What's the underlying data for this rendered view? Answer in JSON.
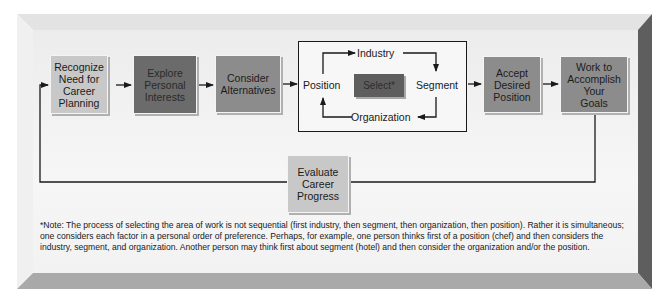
{
  "diagram": {
    "steps": [
      {
        "id": "recognize",
        "label_lines": [
          "Recognize",
          "Need for",
          "Career",
          "Planning"
        ]
      },
      {
        "id": "explore",
        "label_lines": [
          "Explore",
          "Personal",
          "Interests"
        ]
      },
      {
        "id": "consider",
        "label_lines": [
          "Consider",
          "Alternatives"
        ]
      },
      {
        "id": "accept",
        "label_lines": [
          "Accept",
          "Desired",
          "Position"
        ]
      },
      {
        "id": "work",
        "label_lines": [
          "Work to",
          "Accomplish",
          "Your",
          "Goals"
        ]
      },
      {
        "id": "evaluate",
        "label_lines": [
          "Evaluate",
          "Career",
          "Progress"
        ]
      }
    ],
    "selection_cycle": {
      "center": "Select*",
      "nodes": {
        "industry": "Industry",
        "segment": "Segment",
        "organization": "Organization",
        "position": "Position"
      }
    },
    "note": "*Note: The process of selecting the area of work is not sequential (first industry, then segment, then organization, then position). Rather it is simultaneous; one considers each factor in a personal order of preference. Perhaps, for example, one person thinks first of a position (chef) and then considers the industry, segment, and organization. Another person may think first about segment (hotel) and then consider the organization and/or the position."
  },
  "colors": {
    "light_box": "#c8c8c8",
    "mid_box": "#8c8c8c",
    "dark_box": "#6b6b6b",
    "select_box": "#5e5e5e",
    "line": "#1a1a1a"
  }
}
